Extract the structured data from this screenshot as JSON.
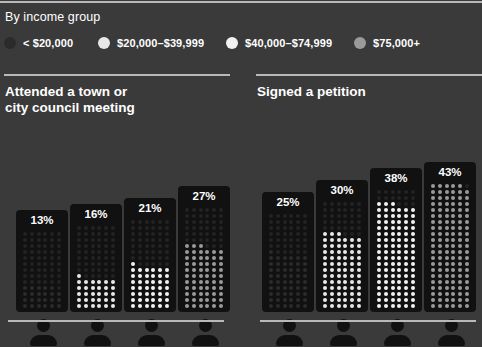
{
  "legend": {
    "title": "By income group",
    "items": [
      {
        "label": "< $20,000",
        "color": "#2b2b2b",
        "marker": "legend-dot-under-20k"
      },
      {
        "label": "$20,000–$39,999",
        "color": "#e8e8e8",
        "marker": "legend-dot-20k-39k"
      },
      {
        "label": "$40,000–$74,999",
        "color": "#f2f2f2",
        "marker": "legend-dot-40k-74k"
      },
      {
        "label": "$75,000+",
        "color": "#9a9a9a",
        "marker": "legend-dot-75k-plus"
      }
    ]
  },
  "panels": [
    {
      "title_line1": "Attended a town or",
      "title_line2": "city council meeting"
    },
    {
      "title_line1": "Signed a petition",
      "title_line2": ""
    }
  ],
  "chart_data": [
    {
      "type": "bar",
      "title": "Attended a town or city council meeting",
      "xlabel": "Income group",
      "ylabel": "Percent",
      "ylim": [
        0,
        100
      ],
      "grid": false,
      "legend_position": "top",
      "categories": [
        "< $20,000",
        "$20,000–$39,999",
        "$40,000–$74,999",
        "$75,000+"
      ],
      "values": [
        13,
        16,
        21,
        27
      ],
      "value_labels": [
        "13%",
        "16%",
        "21%",
        "27%"
      ],
      "series_colors": [
        "#2b2b2b",
        "#e8e8e8",
        "#f2f2f2",
        "#9a9a9a"
      ]
    },
    {
      "type": "bar",
      "title": "Signed a petition",
      "xlabel": "Income group",
      "ylabel": "Percent",
      "ylim": [
        0,
        100
      ],
      "grid": false,
      "legend_position": "top",
      "categories": [
        "< $20,000",
        "$20,000–$39,999",
        "$40,000–$74,999",
        "$75,000+"
      ],
      "values": [
        25,
        30,
        38,
        43
      ],
      "value_labels": [
        "25%",
        "30%",
        "38%",
        "43%"
      ],
      "series_colors": [
        "#2b2b2b",
        "#e8e8e8",
        "#f2f2f2",
        "#9a9a9a"
      ]
    }
  ]
}
